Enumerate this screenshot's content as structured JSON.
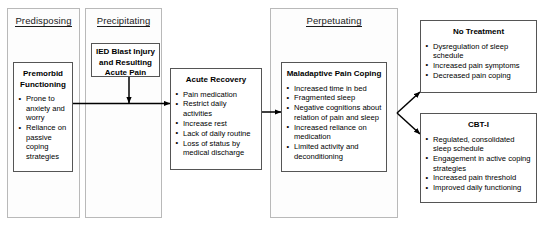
{
  "diagram": {
    "type": "flow-diagram",
    "phases": [
      {
        "id": "predisposing",
        "label": "Predisposing"
      },
      {
        "id": "precipitating",
        "label": "Precipitating"
      },
      {
        "id": "perpetuating",
        "label": "Perpetuating"
      }
    ],
    "nodes": {
      "premorbid": {
        "title": "Premorbid Functioning",
        "items": [
          "Prone to anxiety and worry",
          "Reliance on passive coping strategies"
        ]
      },
      "ied": {
        "title": "IED Blast Injury and Resulting Acute Pain",
        "items": []
      },
      "acute_recovery": {
        "title": "Acute Recovery",
        "items": [
          "Pain medication",
          "Restrict daily activities",
          "Increase rest",
          "Lack of daily routine",
          "Loss of status by medical discharge"
        ]
      },
      "maladaptive": {
        "title": "Maladaptive Pain Coping",
        "items": [
          "Increased time in bed",
          "Fragmented sleep",
          "Negative cognitions about relation of pain and sleep",
          "Increased reliance on medication",
          "Limited activity and deconditioning"
        ]
      },
      "no_treatment": {
        "title": "No Treatment",
        "items": [
          "Dysregulation of sleep schedule",
          "Increased pain symptoms",
          "Decreased pain coping"
        ]
      },
      "cbti": {
        "title": "CBT-I",
        "items": [
          "Regulated, consolidated sleep schedule",
          "Engagement in active coping strategies",
          "Increased pain threshold",
          "Improved daily functioning"
        ]
      }
    },
    "edges": [
      {
        "from": "ied",
        "to": "premorbid-to-acute-junction",
        "style": "vertical-arrow"
      },
      {
        "from": "premorbid",
        "to": "acute_recovery",
        "style": "horizontal-arrow"
      },
      {
        "from": "acute_recovery",
        "to": "maladaptive",
        "style": "horizontal-arrow"
      },
      {
        "from": "maladaptive",
        "to": "no_treatment",
        "style": "branch-up-arrow"
      },
      {
        "from": "maladaptive",
        "to": "cbti",
        "style": "branch-down-arrow"
      }
    ],
    "colors": {
      "background": "#ffffff",
      "outer_border": "#b9b9b9",
      "inner_border": "#555555",
      "text": "#000000",
      "arrow": "#000000"
    }
  }
}
